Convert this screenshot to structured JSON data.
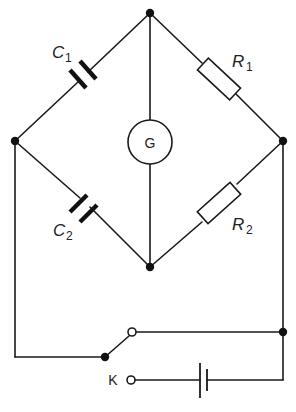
{
  "diagram": {
    "type": "bridge circuit (capacitance bridge)",
    "components": {
      "c1": {
        "symbol": "C",
        "subscript": "1",
        "kind": "capacitor"
      },
      "c2": {
        "symbol": "C",
        "subscript": "2",
        "kind": "capacitor"
      },
      "r1": {
        "symbol": "R",
        "subscript": "1",
        "kind": "resistor"
      },
      "r2": {
        "symbol": "R",
        "subscript": "2",
        "kind": "resistor"
      },
      "galvanometer": {
        "label": "G",
        "kind": "galvanometer"
      },
      "switch": {
        "label": "K",
        "kind": "two-way switch"
      },
      "battery": {
        "kind": "battery"
      }
    },
    "colors": {
      "line": "#1a1a1a",
      "background": "#ffffff"
    }
  }
}
